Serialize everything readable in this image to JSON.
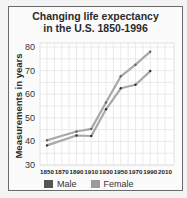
{
  "chart_data": {
    "type": "line",
    "title": "Changing life expectancy in the U.S. 1850-1996",
    "title_lines": [
      "Changing life expectancy",
      "in the U.S. 1850-1996"
    ],
    "xlabel": "",
    "ylabel": "Measurements in years",
    "x_ticks": [
      "1850",
      "1870",
      "1890",
      "1910",
      "1930",
      "1950",
      "1970",
      "1990",
      "2010"
    ],
    "y_ticks": [
      "30",
      "40",
      "50",
      "60",
      "70",
      "80"
    ],
    "xlim": [
      1850,
      2010
    ],
    "ylim": [
      30,
      80
    ],
    "grid": true,
    "legend_position": "bottom",
    "x": [
      1850,
      1890,
      1910,
      1930,
      1950,
      1970,
      1990
    ],
    "series": [
      {
        "name": "Male",
        "color": "#555555",
        "values": [
          38.3,
          42.5,
          42.3,
          53.6,
          62.5,
          64.0,
          69.8
        ]
      },
      {
        "name": "Female",
        "color": "#9a9a9a",
        "values": [
          40.5,
          44.2,
          45.3,
          56.5,
          67.6,
          72.5,
          78.0
        ]
      }
    ]
  },
  "legend": {
    "male_label": "Male",
    "female_label": "Female"
  }
}
